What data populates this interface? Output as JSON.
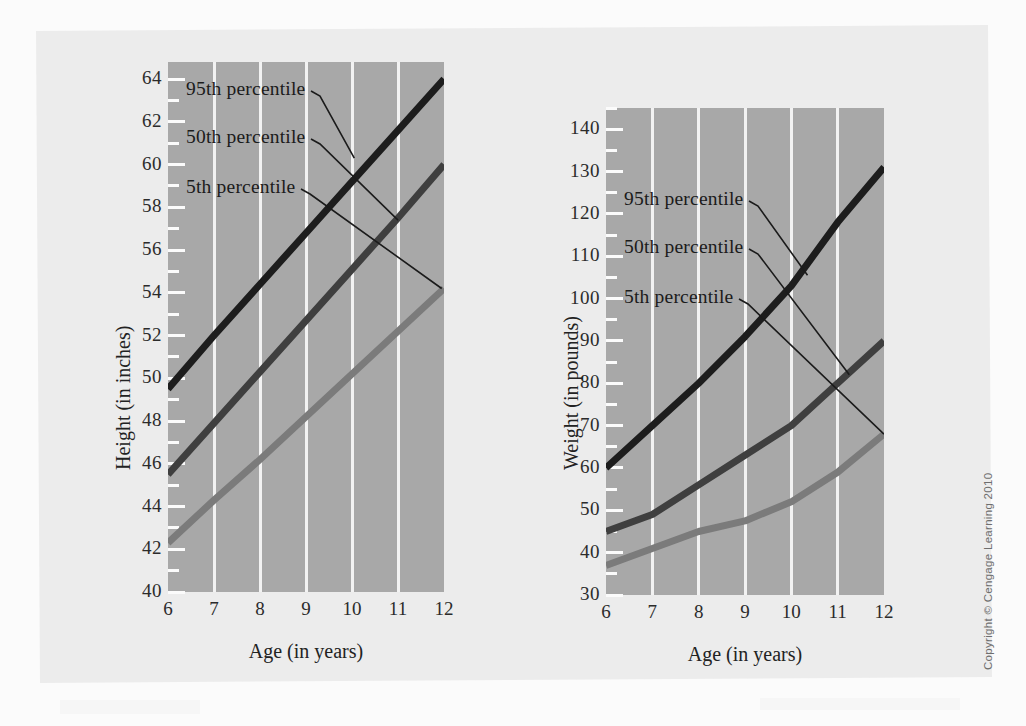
{
  "figure": {
    "copyright": "Copyright © Cengage Learning 2010",
    "background_color": "#ececec",
    "plot_background_color": "#a8a8a8",
    "gridline_color": "#f2f2f2"
  },
  "series_styles": [
    {
      "name": "95th percentile",
      "color": "#1d1d1d",
      "width": 7
    },
    {
      "name": "50th percentile",
      "color": "#3f3f3f",
      "width": 7
    },
    {
      "name": "5th percentile",
      "color": "#7b7b7b",
      "width": 7
    }
  ],
  "chart_data": [
    {
      "type": "line",
      "id": "height-chart",
      "title": "",
      "xlabel": "Age (in years)",
      "ylabel": "Height (in inches)",
      "x": [
        6,
        7,
        8,
        9,
        10,
        11,
        12
      ],
      "xticklabels": [
        "6",
        "7",
        "8",
        "9",
        "10",
        "11",
        "12"
      ],
      "xlim": [
        6,
        12
      ],
      "ylim": [
        40,
        64.8
      ],
      "yticks": [
        40,
        42,
        44,
        46,
        48,
        50,
        52,
        54,
        56,
        58,
        60,
        62,
        64
      ],
      "yticklabels": [
        "40",
        "42",
        "44",
        "46",
        "48",
        "50",
        "52",
        "54",
        "56",
        "58",
        "60",
        "62",
        "64"
      ],
      "yminorstep": 1,
      "grid": "vertical",
      "legend": "inline-annotations",
      "series": [
        {
          "name": "95th percentile",
          "values": [
            49.5,
            52.0,
            54.4,
            56.8,
            59.2,
            61.6,
            64.0
          ]
        },
        {
          "name": "50th percentile",
          "values": [
            45.5,
            47.9,
            50.3,
            52.7,
            55.1,
            57.5,
            60.0
          ]
        },
        {
          "name": "5th percentile",
          "values": [
            42.3,
            44.3,
            46.2,
            48.2,
            50.2,
            52.2,
            54.2
          ]
        }
      ],
      "annotations": [
        {
          "text": "95th percentile",
          "target_x": 10.05,
          "target_y": 60.3
        },
        {
          "text": "50th percentile",
          "target_x": 11.0,
          "target_y": 57.4
        },
        {
          "text": "5th percentile",
          "target_x": 11.95,
          "target_y": 54.2
        }
      ]
    },
    {
      "type": "line",
      "id": "weight-chart",
      "title": "",
      "xlabel": "Age (in years)",
      "ylabel": "Weight (in pounds)",
      "x": [
        6,
        7,
        8,
        9,
        10,
        11,
        12
      ],
      "xticklabels": [
        "6",
        "7",
        "8",
        "9",
        "10",
        "11",
        "12"
      ],
      "xlim": [
        6,
        12
      ],
      "ylim": [
        30,
        145
      ],
      "yticks": [
        30,
        40,
        50,
        60,
        70,
        80,
        90,
        100,
        110,
        120,
        130,
        140
      ],
      "yticklabels": [
        "30",
        "40",
        "50",
        "60",
        "70",
        "80",
        "90",
        "100",
        "110",
        "120",
        "130",
        "140"
      ],
      "yminorstep": 5,
      "grid": "vertical",
      "legend": "inline-annotations",
      "series": [
        {
          "name": "95th percentile",
          "values": [
            60,
            70,
            80,
            91,
            103,
            118,
            131
          ]
        },
        {
          "name": "50th percentile",
          "values": [
            45,
            49,
            56,
            63,
            70,
            80,
            90
          ]
        },
        {
          "name": "5th percentile",
          "values": [
            37,
            41,
            45,
            47.5,
            52,
            59,
            68
          ]
        }
      ],
      "annotations": [
        {
          "text": "95th percentile",
          "target_x": 10.35,
          "target_y": 105.5
        },
        {
          "text": "50th percentile",
          "target_x": 11.25,
          "target_y": 82.0
        },
        {
          "text": "5th percentile",
          "target_x": 12.0,
          "target_y": 68.0
        }
      ]
    }
  ]
}
